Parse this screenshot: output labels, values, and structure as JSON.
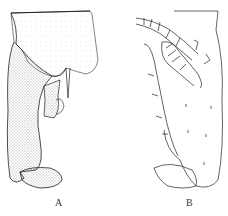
{
  "figure": {
    "panels": [
      {
        "id": "A",
        "label": "A",
        "style": "stippled"
      },
      {
        "id": "B",
        "label": "B",
        "style": "line"
      }
    ],
    "colors": {
      "ink": "#222222",
      "background": "#ffffff"
    }
  }
}
